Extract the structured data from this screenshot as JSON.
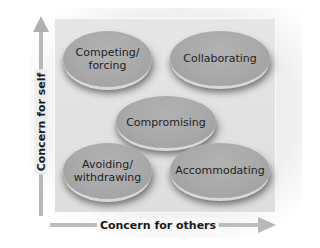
{
  "diagram": {
    "type": "conflict-management-styles-grid",
    "axes": {
      "y_label": "Concern for self",
      "x_label": "Concern for others"
    },
    "styles": [
      {
        "id": "competing",
        "line1": "Competing/",
        "line2": "forcing",
        "position": "top-left"
      },
      {
        "id": "collaborating",
        "line1": "Collaborating",
        "line2": "",
        "position": "top-right"
      },
      {
        "id": "compromising",
        "line1": "Compromising",
        "line2": "",
        "position": "center"
      },
      {
        "id": "avoiding",
        "line1": "Avoiding/",
        "line2": "withdrawing",
        "position": "bottom-left"
      },
      {
        "id": "accommodating",
        "line1": "Accommodating",
        "line2": "",
        "position": "bottom-right"
      }
    ],
    "colors": {
      "ellipse_fill": "#a9a9a9",
      "panel_fill": "#e2e2e2",
      "arrow": "#b8b8b8",
      "text": "#1e1e1e"
    }
  }
}
